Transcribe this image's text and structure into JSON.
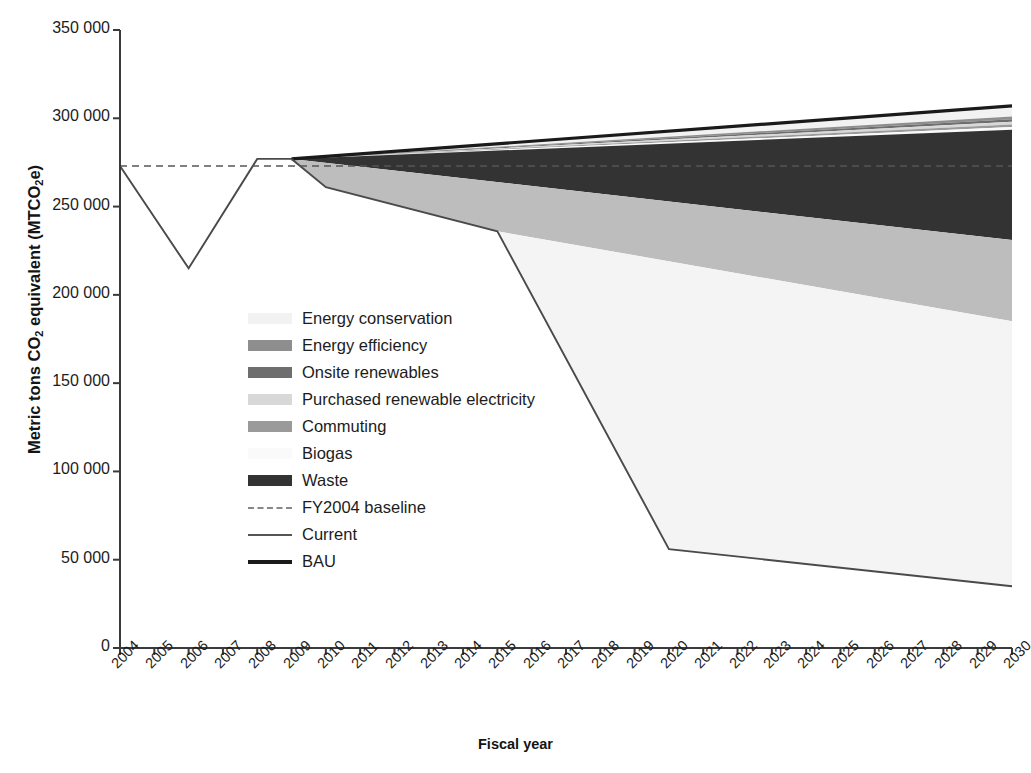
{
  "chart_data": {
    "type": "area",
    "title": "",
    "xlabel": "Fiscal year",
    "ylabel": "Metric tons CO2 equivalent (MTCO2e)",
    "ylabel_prefix": "Metric tons CO",
    "ylabel_sub1": "2",
    "ylabel_mid": " equivalent (MTCO",
    "ylabel_sub2": "2",
    "ylabel_suffix": "e)",
    "grid": false,
    "legend_position": "inside-left",
    "ylim": [
      0,
      350000
    ],
    "ytick_labels": [
      "350 000",
      "300 000",
      "250 000",
      "200 000",
      "150 000",
      "100 000",
      "50 000",
      "0"
    ],
    "ytick_values": [
      350000,
      300000,
      250000,
      200000,
      150000,
      100000,
      50000,
      0
    ],
    "xtick_labels": [
      "2004",
      "2005",
      "2006",
      "2007",
      "2008",
      "2009",
      "2010",
      "2011",
      "2012",
      "2013",
      "2014",
      "2015",
      "2016",
      "2017",
      "2018",
      "2019",
      "2020",
      "2021",
      "2022",
      "2023",
      "2024",
      "2025",
      "2026",
      "2027",
      "2028",
      "2029",
      "2030"
    ],
    "x": [
      2004,
      2005,
      2006,
      2007,
      2008,
      2009,
      2010,
      2011,
      2012,
      2013,
      2014,
      2015,
      2016,
      2017,
      2018,
      2019,
      2020,
      2021,
      2022,
      2023,
      2024,
      2025,
      2026,
      2027,
      2028,
      2029,
      2030
    ],
    "series": [
      {
        "name": "BAU",
        "kind": "line",
        "color": "#1a1a1a",
        "x": [
          2009,
          2030
        ],
        "values": [
          277000,
          307000
        ]
      },
      {
        "name": "Current",
        "kind": "line",
        "color": "#4a4a4a",
        "x": [
          2004,
          2006,
          2008,
          2009,
          2010,
          2015,
          2020,
          2030
        ],
        "values": [
          273000,
          215000,
          277000,
          277000,
          261000,
          236000,
          56000,
          35000
        ]
      },
      {
        "name": "FY2004 baseline",
        "kind": "dashed-line",
        "color": "#555555",
        "x": [
          2004,
          2030
        ],
        "values": [
          273000,
          273000
        ]
      },
      {
        "name": "Energy conservation",
        "kind": "band",
        "color": "#f2f2f2",
        "upper_x": [
          2009,
          2030
        ],
        "upper": [
          277000,
          307000
        ],
        "lower_x": [
          2009,
          2030
        ],
        "lower": [
          277000,
          301000
        ]
      },
      {
        "name": "Energy efficiency",
        "kind": "band",
        "color": "#8e8e8e",
        "upper_x": [
          2009,
          2030
        ],
        "upper": [
          277000,
          301000
        ],
        "lower_x": [
          2009,
          2030
        ],
        "lower": [
          277000,
          299500
        ]
      },
      {
        "name": "Onsite renewables",
        "kind": "band",
        "color": "#6e6e6e",
        "upper_x": [
          2009,
          2030
        ],
        "upper": [
          277000,
          299500
        ],
        "lower_x": [
          2009,
          2030
        ],
        "lower": [
          277000,
          298000
        ]
      },
      {
        "name": "Purchased renewable electricity",
        "kind": "band",
        "color": "#d8d8d8",
        "upper_x": [
          2009,
          2030
        ],
        "upper": [
          277000,
          298000
        ],
        "lower_x": [
          2009,
          2030
        ],
        "lower": [
          277000,
          296500
        ]
      },
      {
        "name": "Commuting",
        "kind": "band",
        "color": "#9a9a9a",
        "upper_x": [
          2009,
          2030
        ],
        "upper": [
          277000,
          296500
        ],
        "lower_x": [
          2009,
          2030
        ],
        "lower": [
          277000,
          295000
        ]
      },
      {
        "name": "Biogas",
        "kind": "band",
        "color": "#fafafa",
        "upper_x": [
          2009,
          2030
        ],
        "upper": [
          277000,
          295000
        ],
        "lower_x": [
          2009,
          2030
        ],
        "lower": [
          277000,
          293500
        ]
      },
      {
        "name": "Waste",
        "kind": "band",
        "color": "#333333",
        "upper_x": [
          2009,
          2030
        ],
        "upper": [
          277000,
          293500
        ],
        "lower_x": [
          2009,
          2030
        ],
        "lower": [
          277000,
          231000
        ]
      },
      {
        "name": "Lower grey band",
        "kind": "band",
        "color": "#bdbdbd",
        "upper_x": [
          2009,
          2030
        ],
        "upper": [
          277000,
          231000
        ],
        "lower_x": [
          2009,
          2010,
          2015,
          2030
        ],
        "lower": [
          277000,
          261000,
          236000,
          185000
        ]
      },
      {
        "name": "Reduction wedge",
        "kind": "band",
        "color": "#f4f4f4",
        "upper_x": [
          2009,
          2010,
          2015,
          2030
        ],
        "upper": [
          277000,
          261000,
          236000,
          185000
        ],
        "lower_x": [
          2009,
          2010,
          2015,
          2020,
          2030
        ],
        "lower": [
          277000,
          261000,
          236000,
          56000,
          35000
        ]
      }
    ],
    "legend": [
      {
        "label": "Energy conservation",
        "swatch": "block",
        "color": "#f2f2f2"
      },
      {
        "label": "Energy efficiency",
        "swatch": "block",
        "color": "#8e8e8e"
      },
      {
        "label": "Onsite renewables",
        "swatch": "block",
        "color": "#6e6e6e"
      },
      {
        "label": "Purchased renewable electricity",
        "swatch": "block",
        "color": "#d8d8d8"
      },
      {
        "label": "Commuting",
        "swatch": "block",
        "color": "#9a9a9a"
      },
      {
        "label": "Biogas",
        "swatch": "block",
        "color": "#fafafa"
      },
      {
        "label": "Waste",
        "swatch": "block",
        "color": "#333333"
      },
      {
        "label": "FY2004 baseline",
        "swatch": "dashed",
        "color": "#888888"
      },
      {
        "label": "Current",
        "swatch": "line",
        "color": "#555555"
      },
      {
        "label": "BAU",
        "swatch": "thickline",
        "color": "#1a1a1a"
      }
    ]
  }
}
